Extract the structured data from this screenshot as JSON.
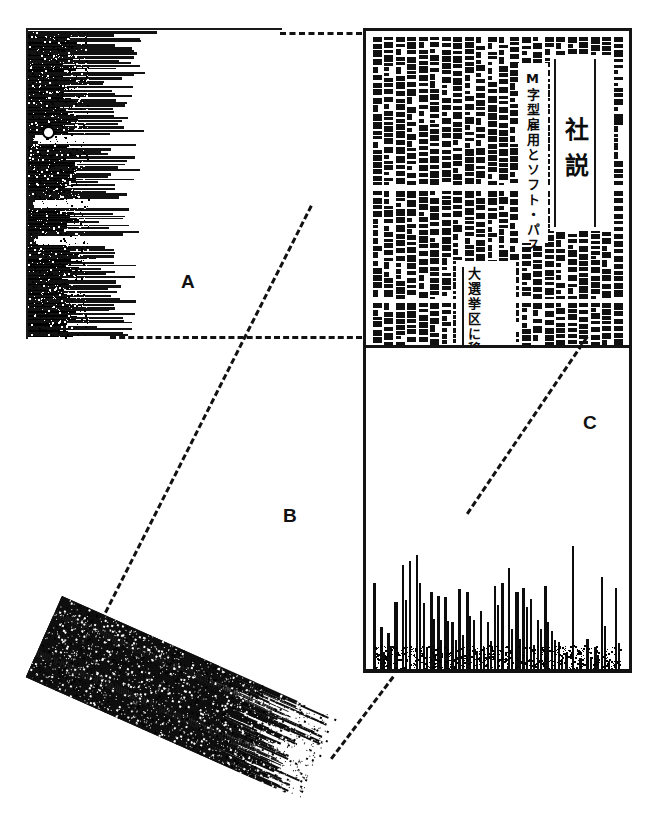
{
  "figure": {
    "background_color": "#ffffff",
    "ink_color": "#111111",
    "width": 671,
    "height": 818
  },
  "regions": [
    {
      "id": "A",
      "label": "A",
      "caption": "A",
      "description": "horizontal run-length projection profile of the upper text block",
      "orientation": "horizontal",
      "position": {
        "left": 26,
        "top": 28,
        "width": 260,
        "height": 311
      }
    },
    {
      "id": "B",
      "label": "B",
      "caption": "B",
      "description": "rotated (skewed) run-length profile blob",
      "orientation": "rotated-24deg",
      "position": {
        "left": 62,
        "top": 596,
        "width": 300,
        "height": 90
      }
    },
    {
      "id": "C",
      "label": "C",
      "caption": "C",
      "description": "vertical projection profile of the newspaper column text",
      "orientation": "vertical",
      "position": {
        "left": 363,
        "top": 345,
        "width": 269,
        "height": 325
      }
    }
  ],
  "newspaper": {
    "frame": {
      "left": 363,
      "top": 28,
      "width": 269,
      "height": 645
    },
    "masthead": "社説",
    "headlines": [
      "M字型雇用とソフト・パス",
      "大選挙区に移る"
    ],
    "column_count": 22,
    "script": "japanese-vertical"
  },
  "connectors": [
    {
      "name": "a-top-to-frame",
      "style": "dashed",
      "from": [
        280,
        32
      ],
      "to": [
        362,
        32
      ]
    },
    {
      "name": "a-bottom-to-frame",
      "style": "dashed",
      "from": [
        110,
        336
      ],
      "to": [
        362,
        336
      ]
    },
    {
      "name": "b-diagonal-to-a",
      "style": "dashed",
      "from": [
        96,
        628
      ],
      "to": [
        310,
        205
      ]
    },
    {
      "name": "b-bottom-to-frame",
      "style": "dashed",
      "from": [
        330,
        758
      ],
      "to": [
        392,
        676
      ]
    },
    {
      "name": "c-diagonal",
      "style": "dashed",
      "from": [
        466,
        513
      ],
      "to": [
        586,
        336
      ]
    }
  ],
  "chart_data": {
    "type": "bar",
    "xlabel": "",
    "ylabel": "",
    "grid": false,
    "legend": null,
    "ylim": [
      0,
      100
    ],
    "series": [
      {
        "name": "region-c-vertical-projection",
        "values": [
          58,
          30,
          26,
          46,
          70,
          72,
          76,
          45,
          52,
          50,
          49,
          33,
          54,
          52,
          34,
          40,
          33,
          56,
          58,
          68,
          52,
          55,
          48,
          34,
          56,
          27,
          20,
          12,
          82,
          10,
          22,
          17,
          62,
          8,
          55
        ]
      }
    ],
    "secondary": {
      "name": "region-a-horizontal-run-profile",
      "type": "bar",
      "orientation": "horizontal",
      "values": [
        96,
        60,
        74,
        86,
        52,
        78,
        66,
        90,
        70,
        58,
        62,
        88,
        54,
        80,
        64,
        72,
        50,
        46,
        84,
        60,
        56,
        68,
        40,
        76,
        58,
        44,
        66,
        52,
        70,
        48,
        62,
        54,
        80,
        58,
        42,
        66,
        50,
        74,
        60,
        46,
        56,
        64,
        52,
        78,
        44,
        68,
        58,
        50,
        72,
        40,
        62,
        54,
        46,
        66,
        58,
        42,
        70,
        52,
        60,
        48,
        74,
        56,
        44,
        64,
        50,
        68,
        58,
        40,
        72,
        54,
        46,
        62,
        52,
        66,
        44,
        58,
        70,
        48,
        60,
        42,
        74,
        52,
        56,
        64,
        46,
        68,
        50,
        58,
        72,
        44,
        62,
        54,
        66,
        48,
        56,
        70,
        42,
        60,
        52,
        64
      ]
    }
  },
  "labels": {
    "a": "A",
    "b": "B",
    "c": "C"
  }
}
